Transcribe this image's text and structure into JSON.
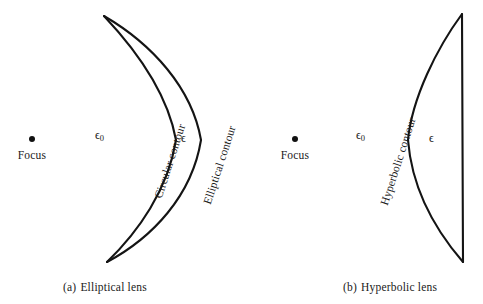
{
  "figure": {
    "panels": [
      {
        "id": "elliptical-lens",
        "caption_index": "(a)",
        "caption_text": "Elliptical lens",
        "focus_label": "Focus",
        "outer_medium": "ϵ",
        "outer_medium_sub": "0",
        "inner_medium": "ϵ",
        "contours": [
          {
            "id": "circular-contour",
            "label": "Circular contour"
          },
          {
            "id": "elliptical-contour",
            "label": "Elliptical contour"
          }
        ]
      },
      {
        "id": "hyperbolic-lens",
        "caption_index": "(b)",
        "caption_text": "Hyperbolic lens",
        "focus_label": "Focus",
        "outer_medium": "ϵ",
        "outer_medium_sub": "0",
        "inner_medium": "ϵ",
        "contours": [
          {
            "id": "hyperbolic-contour",
            "label": "Hyperbolic contour"
          }
        ]
      }
    ],
    "colors": {
      "ink": "#1a1a1a",
      "stroke": "#141414",
      "background": "#ffffff"
    },
    "geometry": {
      "elliptical": {
        "cusp_top": [
          104,
          16
        ],
        "cusp_bottom": [
          107,
          262
        ],
        "circular_vertex": [
          176,
          140
        ],
        "elliptical_vertex": [
          201,
          140
        ],
        "focus_point": [
          32,
          140
        ]
      },
      "hyperbolic": {
        "top_corner": [
          462,
          14
        ],
        "bottom_corner": [
          463,
          262
        ],
        "hyperbola_vertex": [
          408,
          140
        ],
        "focus_point": [
          295,
          140
        ]
      }
    }
  }
}
